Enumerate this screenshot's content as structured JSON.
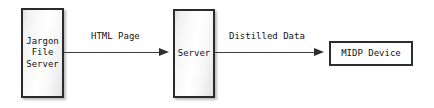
{
  "diagram": {
    "type": "flow-diagram",
    "background_color": "#ffffff",
    "nodes": [
      {
        "id": "jargon-file-server",
        "label": "Jargon\nFile\nServer",
        "shape": "rectangle",
        "style": "shaded-3d",
        "border_color": "#2b2b2b",
        "fill_color": "#f4f4f4"
      },
      {
        "id": "server",
        "label": "Server",
        "shape": "rectangle",
        "style": "shaded-3d",
        "border_color": "#2b2b2b",
        "fill_color": "#f4f4f4"
      },
      {
        "id": "midp-device",
        "label": "MIDP Device",
        "shape": "rectangle",
        "style": "flat",
        "border_color": "#2d2d2d",
        "fill_color": "#ffffff"
      }
    ],
    "edges": [
      {
        "id": "html-page",
        "label": "HTML Page",
        "from": "jargon-file-server",
        "to": "server",
        "arrow": "filled-triangle",
        "line_color": "#3a3a3a"
      },
      {
        "id": "distilled-data",
        "label": "Distilled Data",
        "from": "server",
        "to": "midp-device",
        "arrow": "filled-triangle",
        "line_color": "#3a3a3a"
      }
    ]
  }
}
